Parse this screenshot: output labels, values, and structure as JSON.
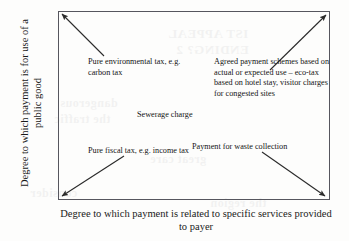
{
  "diagram": {
    "axes": {
      "y_label": "Degree to which payment is for use of a public good",
      "x_label": "Degree to which payment is related to specific services provided to payer"
    },
    "labels": {
      "pure_environmental_tax": "Pure environmental tax, e.g. carbon tax",
      "agreed_payment_schemes": "Agreed payment schemes based on actual or expected use – eco-tax based on hotel stay, visitor charges for congested sites",
      "sewerage_charge": "Sewerage charge",
      "pure_fiscal_tax": "Pure fiscal tax, e.g. income tax",
      "payment_waste_collection": "Payment for waste collection"
    },
    "colors": {
      "frame": "#56565e",
      "arrow": "#2a2a2a",
      "text": "#141414",
      "page": "#fdfdfc"
    }
  },
  "ghost_text": {
    "line1": "IST APPEAL",
    "line2": "ENDING? 2",
    "line3": "dangerous",
    "line4": "the traffic",
    "line5": "great care",
    "line6": "consider",
    "line7": "the region"
  }
}
